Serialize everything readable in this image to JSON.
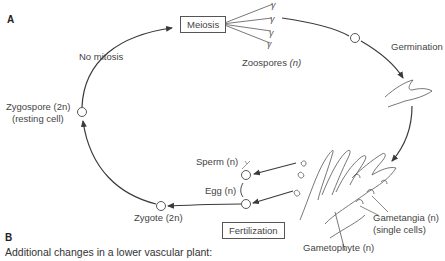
{
  "figure": {
    "section_a": "A",
    "section_b": "B",
    "caption_b": "Additional changes in a lower vascular plant:",
    "boxes": {
      "meiosis": "Meiosis",
      "fertilization": "Fertilization"
    },
    "labels": {
      "no_mitosis": "No mitosis",
      "zoospores": "Zoospores",
      "zoospores_ploidy": "(n)",
      "germination": "Germination",
      "zygospore": "Zygospore (2n)",
      "zygospore_note": "(resting cell)",
      "sperm": "Sperm (n)",
      "egg": "Egg (n)",
      "zygote": "Zygote  (2n)",
      "gametangia": "Gametangia (n)",
      "gametangia_note": "(single cells)",
      "gametophyte": "Gametophyte (n)"
    },
    "stroke_color": "#3a3a3a"
  }
}
